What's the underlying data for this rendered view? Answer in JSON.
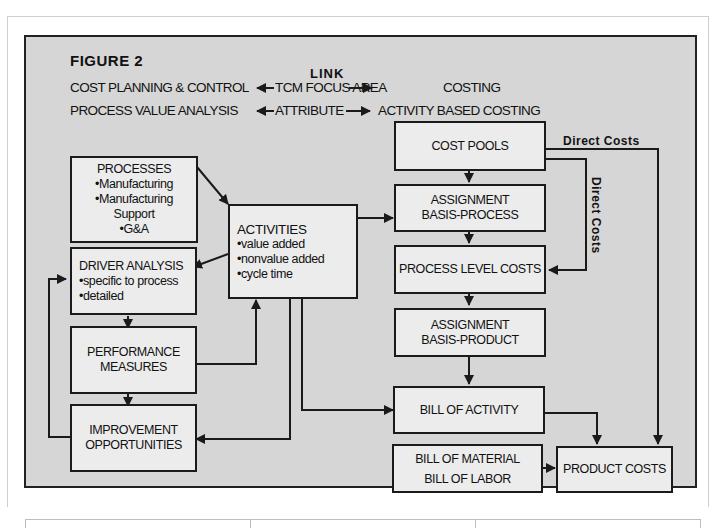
{
  "figure": {
    "title": "FIGURE  2",
    "link_header": "LINK",
    "header_rows": [
      {
        "left": "COST PLANNING & CONTROL",
        "middle": "TCM FOCUS AREA",
        "right": "COSTING"
      },
      {
        "left": "PROCESS VALUE ANALYSIS",
        "middle": "ATTRIBUTE",
        "right": "ACTIVITY BASED COSTING"
      }
    ]
  },
  "boxes": {
    "processes": {
      "title": "PROCESSES",
      "items": [
        "Manufacturing",
        "Manufacturing",
        "Support",
        "G&A"
      ]
    },
    "activities": {
      "title": "ACTIVITIES",
      "items": [
        "value added",
        "nonvalue added",
        "cycle time"
      ]
    },
    "driver_analysis": {
      "title": "DRIVER ANALYSIS",
      "items": [
        "specific to process",
        "detailed"
      ]
    },
    "performance_measures": {
      "lines": [
        "PERFORMANCE",
        "MEASURES"
      ]
    },
    "improvement_opportunities": {
      "lines": [
        "IMPROVEMENT",
        "OPPORTUNITIES"
      ]
    },
    "cost_pools": {
      "label": "COST POOLS"
    },
    "assignment_process": {
      "lines": [
        "ASSIGNMENT",
        "BASIS-PROCESS"
      ]
    },
    "process_level_costs": {
      "label": "PROCESS LEVEL COSTS"
    },
    "assignment_product": {
      "lines": [
        "ASSIGNMENT",
        "BASIS-PRODUCT"
      ]
    },
    "bill_of_activity": {
      "label": "BILL OF ACTIVITY"
    },
    "bill_material_labor": {
      "lines": [
        "BILL OF MATERIAL",
        "BILL OF LABOR"
      ]
    },
    "product_costs": {
      "label": "PRODUCT COSTS"
    }
  },
  "edge_labels": {
    "direct_costs_horizontal": "Direct Costs",
    "direct_costs_vertical": "Direct  Costs"
  },
  "colors": {
    "panel_bg": "#d6d6d6",
    "box_bg": "#ececec",
    "line": "#1a1a1a"
  }
}
